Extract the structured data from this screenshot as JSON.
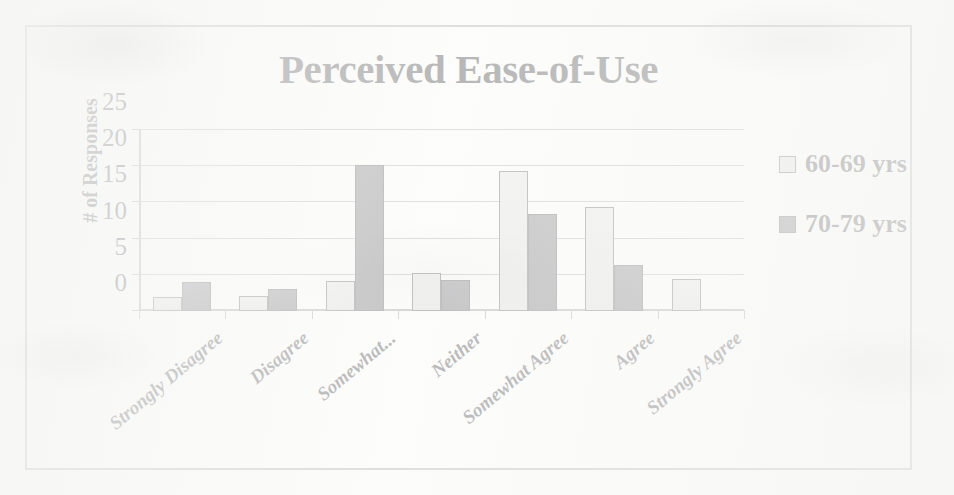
{
  "chart_data": {
    "type": "bar",
    "title": "Perceived Ease-of-Use",
    "xlabel": "",
    "ylabel": "# of Responses",
    "ylim": [
      0,
      25
    ],
    "yticks": [
      0,
      5,
      10,
      15,
      20,
      25
    ],
    "ytick_labels": [
      "0",
      "5",
      "10",
      "15",
      "20",
      "25"
    ],
    "grid": true,
    "legend_position": "right",
    "categories": [
      "Strongly Disagree",
      "Disagree",
      "Somewhat...",
      "Neither",
      "Somewhat Agree",
      "Agree",
      "Strongly Agree"
    ],
    "series": [
      {
        "name": "60-69 yrs",
        "color": "#d7d7d5",
        "values": [
          2.0,
          2.1,
          4.1,
          5.2,
          19.4,
          14.4,
          4.4
        ]
      },
      {
        "name": "70-79 yrs",
        "color": "#53535a",
        "values": [
          4.0,
          3.0,
          20.2,
          4.3,
          13.4,
          6.4,
          0
        ]
      }
    ]
  },
  "legend": {
    "items": [
      {
        "label": "60-69 yrs",
        "swatch": "light-gray-swatch-icon"
      },
      {
        "label": "70-79 yrs",
        "swatch": "dark-gray-swatch-icon"
      }
    ]
  }
}
